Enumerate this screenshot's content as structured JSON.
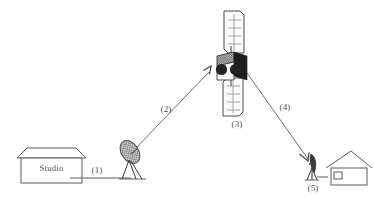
{
  "diagram": {
    "background_color": "#ffffff",
    "line_color": "#5a5a5a",
    "dark_fill": "#1d1d1d",
    "text_color": "#4d4d4d",
    "nodes": {
      "studio": {
        "label": "Studio",
        "icon": "studio-building-icon"
      },
      "uplink_dish": {
        "icon": "uplink-dish-icon"
      },
      "satellite": {
        "icon": "satellite-icon"
      },
      "receiver_dish": {
        "icon": "receiver-dish-icon"
      },
      "house": {
        "icon": "house-icon"
      }
    },
    "labels": {
      "cable": "(1)",
      "uplink": "(2)",
      "satellite": "(3)",
      "downlink": "(4)",
      "receiver": "(5)"
    }
  }
}
